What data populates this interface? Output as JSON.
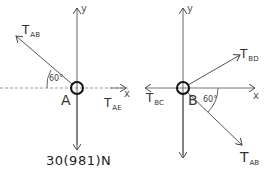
{
  "diagram_a": {
    "point_label": "A",
    "y_axis_label": "y",
    "x_axis_label": "x",
    "forces": [
      {
        "name": "T",
        "sub": "AB",
        "direction": "up-left"
      },
      {
        "name": "T",
        "sub": "AE",
        "direction": "right"
      },
      {
        "name": "weight",
        "label": "30(981)N",
        "direction": "down"
      }
    ],
    "angle_label": "60°"
  },
  "diagram_b": {
    "point_label": "B",
    "y_axis_label": "y",
    "x_axis_label": "x",
    "forces": [
      {
        "name": "T",
        "sub": "BD",
        "direction": "up-right"
      },
      {
        "name": "T",
        "sub": "BC",
        "direction": "left"
      },
      {
        "name": "T",
        "sub": "AB",
        "direction": "down-right"
      }
    ],
    "angle_label": "60°"
  },
  "colors": {
    "ink": "#333333",
    "axis": "#888888",
    "circle": "#111111"
  }
}
